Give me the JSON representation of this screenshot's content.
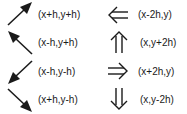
{
  "left_column": [
    {
      "direction": "up-right",
      "icon": "arrow-up-right",
      "label": "(x+h,y+h)"
    },
    {
      "direction": "up-left",
      "icon": "arrow-up-left",
      "label": "(x-h,y+h)"
    },
    {
      "direction": "down-left",
      "icon": "arrow-down-left",
      "label": "(x-h,y-h)"
    },
    {
      "direction": "down-right",
      "icon": "arrow-down-right",
      "label": "(x+h,y-h)"
    }
  ],
  "right_column": [
    {
      "direction": "left",
      "icon": "double-arrow-left",
      "label": "(x-2h,y)"
    },
    {
      "direction": "up",
      "icon": "double-arrow-up",
      "label": "(x,y+2h)"
    },
    {
      "direction": "right",
      "icon": "double-arrow-right",
      "label": "(x+2h,y)"
    },
    {
      "direction": "down",
      "icon": "double-arrow-down",
      "label": "(x,y-2h)"
    }
  ],
  "colors": {
    "ink": "#1a1a1a",
    "background": "#ffffff"
  }
}
